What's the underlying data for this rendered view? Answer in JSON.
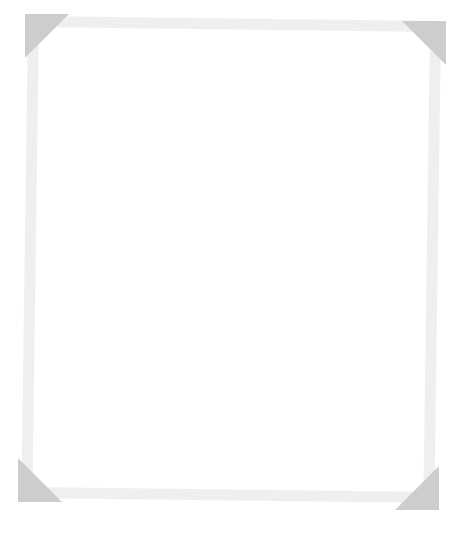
{
  "frame": {
    "border_color": "#efefef",
    "corner_color": "#cdcdcd",
    "background": "#ffffff"
  }
}
